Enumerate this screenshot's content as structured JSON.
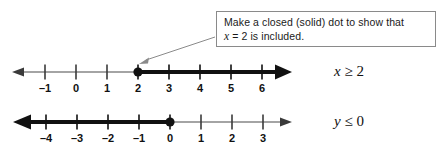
{
  "callout": {
    "line1_prefix": "Make a closed (solid) dot to show that",
    "line2_var": "x",
    "line2_rest": " = 2 is included."
  },
  "number_lines": [
    {
      "id": "number-line-1",
      "label_var": "x",
      "label_rest": " ≥ 2",
      "ticks": [
        "–1",
        "0",
        "1",
        "2",
        "3",
        "4",
        "5",
        "6"
      ],
      "tick_values": [
        -1,
        0,
        1,
        2,
        3,
        4,
        5,
        6
      ],
      "dot_value": 2,
      "dot_style": "closed",
      "shaded_direction": "right",
      "left_arrow": "thin",
      "right_arrow": "thick"
    },
    {
      "id": "number-line-2",
      "label_var": "y",
      "label_rest": " ≤ 0",
      "ticks": [
        "–4",
        "–3",
        "–2",
        "–1",
        "0",
        "1",
        "2",
        "3"
      ],
      "tick_values": [
        -4,
        -3,
        -2,
        -1,
        0,
        1,
        2,
        3
      ],
      "dot_value": 0,
      "dot_style": "closed",
      "shaded_direction": "left",
      "left_arrow": "thick",
      "right_arrow": "thin"
    }
  ],
  "colors": {
    "ink": "#111111",
    "thin_line": "#4a4a4a",
    "box_border": "#8a8a8a",
    "leader": "#8a8a8a",
    "background": "#ffffff"
  },
  "geometry": {
    "axis1_y": 72,
    "axis2_y": 122,
    "tick_spacing": 31,
    "line1_first_tick_x": 45,
    "line2_first_tick_x": 46,
    "axis_left_x": 13,
    "axis_right_x": 292,
    "callout_box": {
      "x": 216,
      "y": 11,
      "width": 220,
      "height": 36
    }
  }
}
